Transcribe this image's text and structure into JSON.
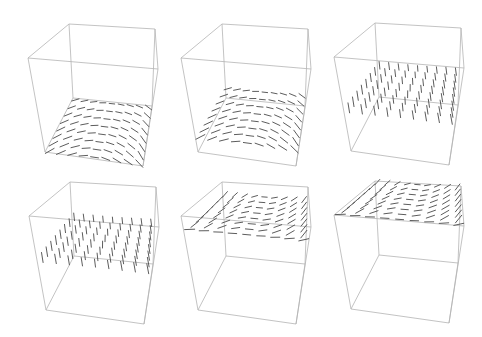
{
  "figure": {
    "edge_color": "#b4b4b4",
    "vector_color": "#4a4a4a",
    "background": "#ffffff"
  },
  "cube_template": {
    "vertices": {
      "back_top_left": [
        69,
        24
      ],
      "back_top_right": [
        155,
        29
      ],
      "front_top_left": [
        28,
        58
      ],
      "front_top_right": [
        158,
        69
      ],
      "back_bottom_left": [
        73,
        98
      ],
      "back_bottom_right": [
        152,
        106
      ],
      "front_bottom_left": [
        45,
        152
      ],
      "front_bottom_right": [
        143,
        166
      ]
    }
  },
  "panels": [
    {
      "id": 1,
      "row": 0,
      "col": 0,
      "offset": [
        0,
        0
      ],
      "slice_height": 0.0,
      "pattern": "saddle"
    },
    {
      "id": 2,
      "row": 0,
      "col": 1,
      "offset": [
        153,
        0
      ],
      "slice_height": 0.15,
      "pattern": "saddle"
    },
    {
      "id": 3,
      "row": 0,
      "col": 2,
      "offset": [
        306,
        -1
      ],
      "slice_height": 0.45,
      "pattern": "vertical"
    },
    {
      "id": 4,
      "row": 1,
      "col": 0,
      "offset": [
        1,
        158
      ],
      "slice_height": 0.55,
      "pattern": "vertical"
    },
    {
      "id": 5,
      "row": 1,
      "col": 1,
      "offset": [
        153,
        158
      ],
      "slice_height": 0.85,
      "pattern": "swirl"
    },
    {
      "id": 6,
      "row": 1,
      "col": 2,
      "offset": [
        306,
        157
      ],
      "slice_height": 1.0,
      "pattern": "swirl"
    }
  ],
  "grid": {
    "rows": 8,
    "cols": 9,
    "segment_length": 9
  }
}
